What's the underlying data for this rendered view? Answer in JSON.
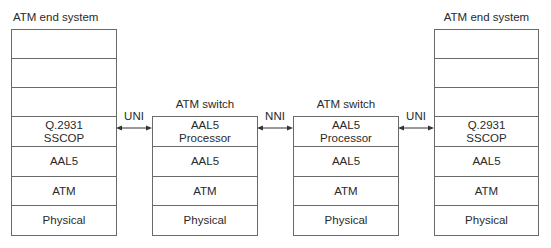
{
  "caption": "",
  "end_system_left": {
    "title": "ATM end system",
    "layers": [
      "",
      "",
      "",
      "Q.2931\nSSCOP",
      "AAL5",
      "ATM",
      "Physical"
    ]
  },
  "switch_1": {
    "title": "ATM switch",
    "layers": [
      "AAL5\nProcessor",
      "AAL5",
      "ATM",
      "Physical"
    ]
  },
  "switch_2": {
    "title": "ATM switch",
    "layers": [
      "AAL5\nProcessor",
      "AAL5",
      "ATM",
      "Physical"
    ]
  },
  "end_system_right": {
    "title": "ATM end system",
    "layers": [
      "",
      "",
      "",
      "Q.2931\nSSCOP",
      "AAL5",
      "ATM",
      "Physical"
    ]
  },
  "interfaces": [
    {
      "label": "UNI",
      "icon": "double-arrow-icon"
    },
    {
      "label": "NNI",
      "icon": "double-arrow-icon"
    },
    {
      "label": "UNI",
      "icon": "double-arrow-icon"
    }
  ],
  "colors": {
    "line": "#6a6a6a",
    "text": "#2a2a2a"
  }
}
